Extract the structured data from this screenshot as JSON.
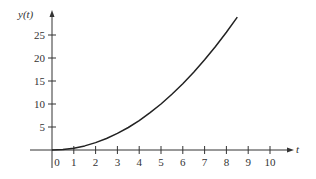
{
  "chart_data": {
    "type": "line",
    "title": "",
    "xlabel": "t",
    "ylabel": "y(t)",
    "xlim": [
      -1,
      11.4
    ],
    "ylim": [
      -5,
      31
    ],
    "x_ticks": [
      0,
      1,
      2,
      3,
      4,
      5,
      6,
      7,
      8,
      9,
      10
    ],
    "x_tick_labels": [
      "0",
      "1",
      "2",
      "3",
      "4",
      "5",
      "6",
      "7",
      "8",
      "9",
      "10"
    ],
    "y_ticks": [
      5,
      10,
      15,
      20,
      25
    ],
    "y_tick_labels": [
      "5",
      "10",
      "15",
      "20",
      "25"
    ],
    "grid": false,
    "legend": null,
    "series": [
      {
        "name": "y(t)",
        "color": "#222222",
        "x": [
          0,
          0.5,
          1,
          1.5,
          2,
          2.5,
          3,
          3.5,
          4,
          4.5,
          5,
          5.5,
          6,
          6.5,
          7,
          7.5,
          8,
          8.5
        ],
        "y": [
          0,
          0.1,
          0.4,
          0.9,
          1.6,
          2.5,
          3.6,
          4.9,
          6.4,
          8.1,
          10.0,
          12.1,
          14.4,
          16.9,
          19.6,
          22.5,
          25.6,
          28.9
        ]
      }
    ]
  },
  "colors": {
    "axis": "#333333",
    "curve": "#222222",
    "background": "#ffffff"
  }
}
